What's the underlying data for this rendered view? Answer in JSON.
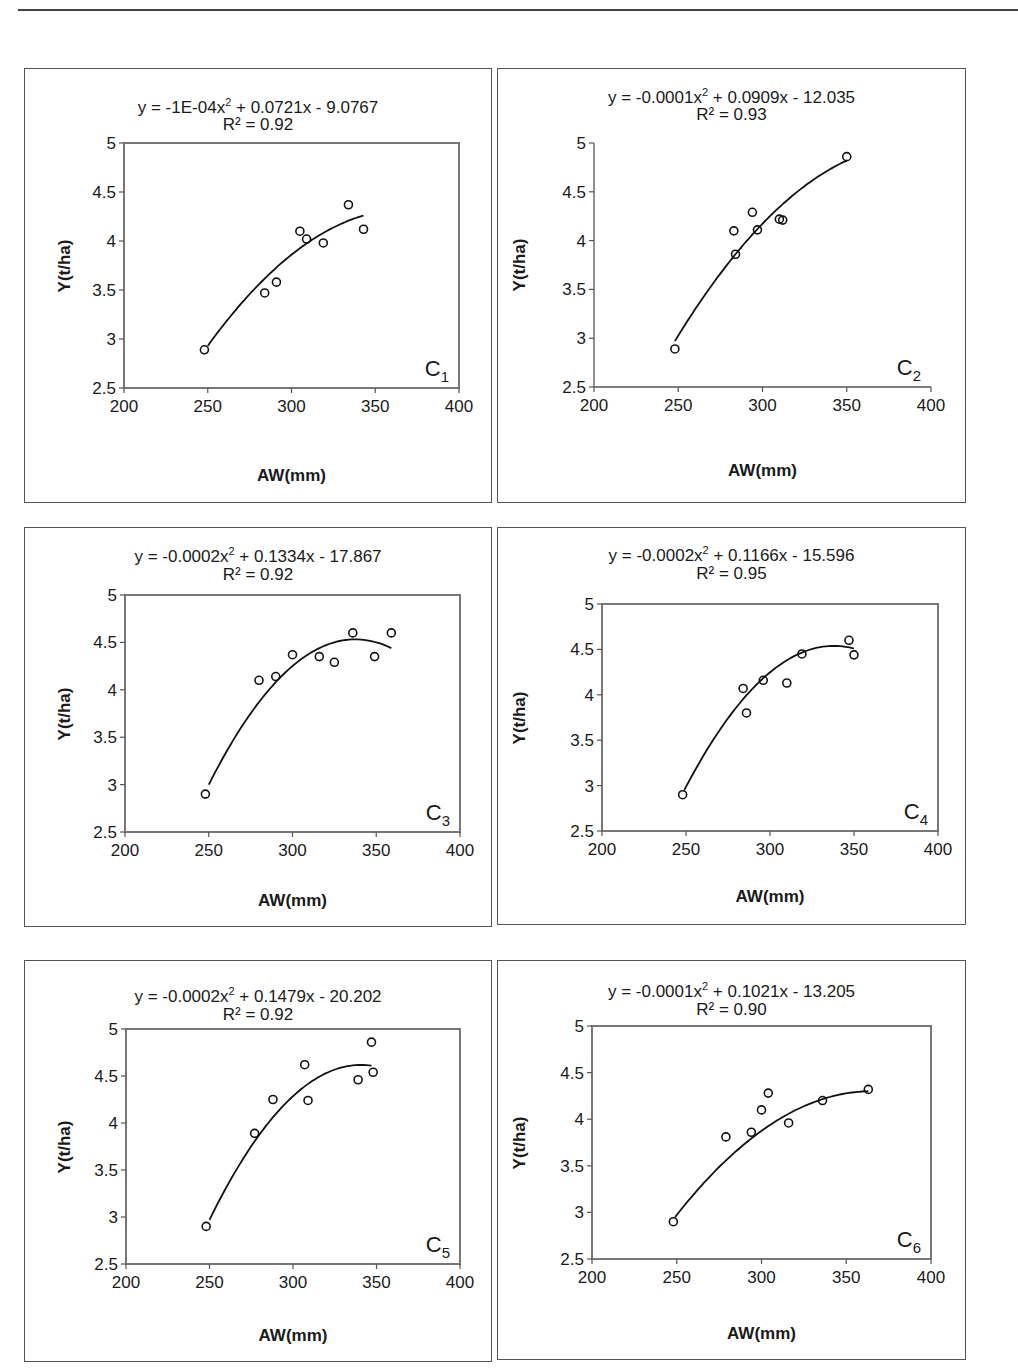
{
  "page": {
    "header_rule": true
  },
  "chart_data": [
    {
      "type": "scatter",
      "id": "C1",
      "label": "C",
      "label_sub": "1",
      "equation": "y = -1E-04x² + 0.0721x - 9.0767",
      "equation_parts": {
        "pre": "y = -1E-04x",
        "sup": "2",
        "post": " + 0.0721x - 9.0767"
      },
      "r2": "R² = 0.92",
      "xlabel": "AW(mm)",
      "ylabel": "Y(t/ha)",
      "xlim": [
        200,
        400
      ],
      "ylim": [
        2.5,
        5
      ],
      "xticks": [
        "200",
        "250",
        "300",
        "350",
        "400"
      ],
      "yticks": [
        "2.5",
        "3",
        "3.5",
        "4",
        "4.5",
        "5"
      ],
      "plot_frame": "box",
      "fit": {
        "a": -0.0001,
        "b": 0.0721,
        "c": -9.0767,
        "x_range": [
          250,
          343
        ],
        "y_start": 2.93,
        "y_end": 4.26
      },
      "points": [
        [
          248,
          2.89
        ],
        [
          284,
          3.47
        ],
        [
          291,
          3.58
        ],
        [
          305,
          4.1
        ],
        [
          309,
          4.02
        ],
        [
          319,
          3.98
        ],
        [
          334,
          4.37
        ],
        [
          343,
          4.12
        ]
      ]
    },
    {
      "type": "scatter",
      "id": "C2",
      "label": "C",
      "label_sub": "2",
      "equation": "y = -0.0001x² + 0.0909x - 12.035",
      "equation_parts": {
        "pre": "y = -0.0001x",
        "sup": "2",
        "post": " + 0.0909x - 12.035"
      },
      "r2": "R² = 0.93",
      "xlabel": "AW(mm)",
      "ylabel": "Y(t/ha)",
      "xlim": [
        200,
        400
      ],
      "ylim": [
        2.5,
        5
      ],
      "xticks": [
        "200",
        "250",
        "300",
        "350",
        "400"
      ],
      "yticks": [
        "2.5",
        "3",
        "3.5",
        "4",
        "4.5",
        "5"
      ],
      "plot_frame": "axes",
      "fit": {
        "a": -0.0001,
        "b": 0.0909,
        "c": -12.035,
        "x_range": [
          248,
          350
        ],
        "y_start": 2.97,
        "y_end": 4.82
      },
      "points": [
        [
          248,
          2.89
        ],
        [
          283,
          4.1
        ],
        [
          284,
          3.86
        ],
        [
          294,
          4.29
        ],
        [
          297,
          4.11
        ],
        [
          310,
          4.22
        ],
        [
          312,
          4.21
        ],
        [
          350,
          4.86
        ]
      ]
    },
    {
      "type": "scatter",
      "id": "C3",
      "label": "C",
      "label_sub": "3",
      "equation": "y = -0.0002x² + 0.1334x - 17.867",
      "equation_parts": {
        "pre": "y = -0.0002x",
        "sup": "2",
        "post": " + 0.1334x - 17.867"
      },
      "r2": "R² = 0.92",
      "xlabel": "AW(mm)",
      "ylabel": "Y(t/ha)",
      "xlim": [
        200,
        400
      ],
      "ylim": [
        2.5,
        5
      ],
      "xticks": [
        "200",
        "250",
        "300",
        "350",
        "400"
      ],
      "yticks": [
        "2.5",
        "3",
        "3.5",
        "4",
        "4.5",
        "5"
      ],
      "plot_frame": "box",
      "fit": {
        "a": -0.0002,
        "b": 0.1334,
        "c": -17.867,
        "x_range": [
          250,
          359
        ],
        "y_start": 3.0,
        "y_end": 4.44
      },
      "points": [
        [
          248,
          2.9
        ],
        [
          280,
          4.1
        ],
        [
          290,
          4.14
        ],
        [
          300,
          4.37
        ],
        [
          316,
          4.35
        ],
        [
          325,
          4.29
        ],
        [
          336,
          4.6
        ],
        [
          349,
          4.35
        ],
        [
          359,
          4.6
        ]
      ]
    },
    {
      "type": "scatter",
      "id": "C4",
      "label": "C",
      "label_sub": "4",
      "equation": "y = -0.0002x² + 0.1166x - 15.596",
      "equation_parts": {
        "pre": "y = -0.0002x",
        "sup": "2",
        "post": " + 0.1166x - 15.596"
      },
      "r2": "R² = 0.95",
      "xlabel": "AW(mm)",
      "ylabel": "Y(t/ha)",
      "xlim": [
        200,
        400
      ],
      "ylim": [
        2.5,
        5
      ],
      "xticks": [
        "200",
        "250",
        "300",
        "350",
        "400"
      ],
      "yticks": [
        "2.5",
        "3",
        "3.5",
        "4",
        "4.5",
        "5"
      ],
      "plot_frame": "box",
      "fit": {
        "a": -0.0002,
        "b": 0.1166,
        "c": -15.596,
        "x_range": [
          249,
          350
        ],
        "y_start": 2.95,
        "y_end": 4.51
      },
      "points": [
        [
          248,
          2.9
        ],
        [
          284,
          4.07
        ],
        [
          286,
          3.8
        ],
        [
          296,
          4.16
        ],
        [
          310,
          4.13
        ],
        [
          319,
          4.45
        ],
        [
          347,
          4.6
        ],
        [
          350,
          4.44
        ]
      ]
    },
    {
      "type": "scatter",
      "id": "C5",
      "label": "C",
      "label_sub": "5",
      "equation": "y = -0.0002x² + 0.1479x - 20.202",
      "equation_parts": {
        "pre": "y = -0.0002x",
        "sup": "2",
        "post": " + 0.1479x - 20.202"
      },
      "r2": "R² = 0.92",
      "xlabel": "AW(mm)",
      "ylabel": "Y(t/ha)",
      "xlim": [
        200,
        400
      ],
      "ylim": [
        2.5,
        5
      ],
      "xticks": [
        "200",
        "250",
        "300",
        "350",
        "400"
      ],
      "yticks": [
        "2.5",
        "3",
        "3.5",
        "4",
        "4.5",
        "5"
      ],
      "plot_frame": "box",
      "fit": {
        "a": -0.0002,
        "b": 0.1479,
        "c": -20.202,
        "x_range": [
          250,
          347
        ],
        "y_start": 2.97,
        "y_end": 4.61
      },
      "points": [
        [
          248,
          2.9
        ],
        [
          277,
          3.89
        ],
        [
          288,
          4.25
        ],
        [
          307,
          4.62
        ],
        [
          309,
          4.24
        ],
        [
          339,
          4.46
        ],
        [
          347,
          4.86
        ],
        [
          348,
          4.54
        ]
      ]
    },
    {
      "type": "scatter",
      "id": "C6",
      "label": "C",
      "label_sub": "6",
      "equation": "y = -0.0001x² + 0.1021x - 13.205",
      "equation_parts": {
        "pre": "y = -0.0001x",
        "sup": "2",
        "post": " + 0.1021x - 13.205"
      },
      "r2": "R² = 0.90",
      "xlabel": "AW(mm)",
      "ylabel": "Y(t/ha)",
      "xlim": [
        200,
        400
      ],
      "ylim": [
        2.5,
        5
      ],
      "xticks": [
        "200",
        "250",
        "300",
        "350",
        "400"
      ],
      "yticks": [
        "2.5",
        "3",
        "3.5",
        "4",
        "4.5",
        "5"
      ],
      "plot_frame": "box",
      "fit": {
        "a": -0.0001,
        "b": 0.1021,
        "c": -13.205,
        "x_range": [
          249,
          363
        ],
        "y_start": 2.95,
        "y_end": 4.3
      },
      "points": [
        [
          248,
          2.9
        ],
        [
          279,
          3.81
        ],
        [
          294,
          3.86
        ],
        [
          300,
          4.1
        ],
        [
          304,
          4.28
        ],
        [
          316,
          3.96
        ],
        [
          336,
          4.2
        ],
        [
          363,
          4.32
        ]
      ]
    }
  ]
}
